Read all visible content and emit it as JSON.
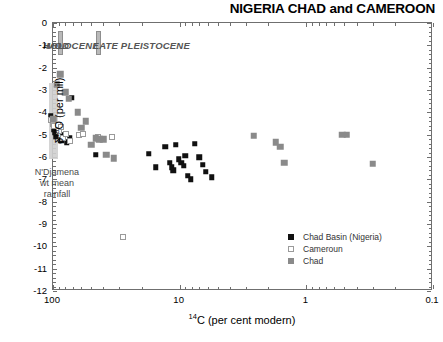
{
  "title": "NIGERIA CHAD and CAMEROON",
  "axes": {
    "y_title_html": "δ<sup>18</sup>O (per mil)",
    "y_title_plain": "δ18O (per mil)",
    "x_title_plain": "14C (per cent modern)",
    "y_ticks": [
      "0",
      "-1",
      "-2",
      "-3",
      "-4",
      "-5",
      "-6",
      "-7",
      "-8",
      "-9",
      "-10",
      "-11",
      "-12"
    ],
    "x_ticks": [
      "100",
      "10",
      "1",
      "0.1"
    ]
  },
  "eras": [
    {
      "label": "MOD",
      "x": 0.22
    },
    {
      "label": "HOLOCENE",
      "x": 0.7
    },
    {
      "label": "LATE PLEISTOCENE",
      "x": 2.15
    }
  ],
  "annotation": {
    "line1": "N'Djamena",
    "line2": "wt mean",
    "line3": "rainfall"
  },
  "legend": {
    "items": [
      {
        "label": "Chad Basin (Nigeria)",
        "key": "nigeria",
        "color": "#111111"
      },
      {
        "label": "Cameroun",
        "key": "cameroun",
        "color": "#ffffff"
      },
      {
        "label": "Chad",
        "key": "chad",
        "color": "#8a8a8a"
      }
    ]
  },
  "colors": {
    "nigeria": "#111111",
    "cameroun": "#ffffff",
    "cameroun_edge": "#9a9a9a",
    "chad": "#8a8a8a",
    "axis": "#6f6f6f",
    "band": "#cfcfcf",
    "era_text": "#555555"
  },
  "chart_data": {
    "type": "scatter",
    "title": "NIGERIA CHAD and CAMEROON",
    "xlabel": "14C (per cent modern)",
    "ylabel": "d18O (per mil)",
    "xscale": "log",
    "x_reversed": true,
    "xlim": [
      100,
      0.1
    ],
    "ylim": [
      -12,
      0
    ],
    "x_ticks": [
      100,
      10,
      1,
      0.1
    ],
    "y_ticks": [
      0,
      -1,
      -2,
      -3,
      -4,
      -5,
      -6,
      -7,
      -8,
      -9,
      -10,
      -11,
      -12
    ],
    "grid": false,
    "legend_position": "bottom-right",
    "annotations": [
      {
        "text": "MOD",
        "x": 92,
        "y": -1.0,
        "style": "bold-italic-gray"
      },
      {
        "text": "HOLOCENE",
        "x": 72,
        "y": -1.0,
        "style": "bold-italic-gray"
      },
      {
        "text": "LATE PLEISTOCENE",
        "x": 20,
        "y": -1.0,
        "style": "bold-italic-gray"
      },
      {
        "text": "N'Djamena wt mean rainfall",
        "x": 93,
        "y": -6.6,
        "style": "gray"
      }
    ],
    "bands": [
      {
        "type": "vband",
        "label": "N'Djamena wt mean rainfall",
        "x_center": 100,
        "y_range": [
          -6.1,
          -2.7
        ],
        "color": "#cfcfcf"
      },
      {
        "type": "vline-marker",
        "label": "MOD/HOLOCENE divider",
        "x": 88,
        "y_range": [
          -1.45,
          -0.35
        ],
        "color": "#b9b9b9"
      },
      {
        "type": "vline-marker",
        "label": "HOLOCENE/LATE PLEISTOCENE divider",
        "x": 44,
        "y_range": [
          -1.45,
          -0.35
        ],
        "color": "#b9b9b9"
      }
    ],
    "series": [
      {
        "name": "Chad Basin (Nigeria)",
        "marker": "filled-square",
        "color": "#111111",
        "points": [
          {
            "x": 104,
            "y": -4.15
          },
          {
            "x": 99,
            "y": -4.75
          },
          {
            "x": 97,
            "y": -4.9
          },
          {
            "x": 95,
            "y": -5.1
          },
          {
            "x": 86,
            "y": -5.25
          },
          {
            "x": 84,
            "y": -5.0
          },
          {
            "x": 78,
            "y": -5.35
          },
          {
            "x": 74,
            "y": -5.15
          },
          {
            "x": 71,
            "y": -3.35
          },
          {
            "x": 46,
            "y": -5.9
          },
          {
            "x": 17.5,
            "y": -5.85
          },
          {
            "x": 15.5,
            "y": -6.45
          },
          {
            "x": 13.0,
            "y": -5.55
          },
          {
            "x": 12.0,
            "y": -6.25
          },
          {
            "x": 11.6,
            "y": -6.45
          },
          {
            "x": 11.2,
            "y": -6.6
          },
          {
            "x": 10.7,
            "y": -5.45
          },
          {
            "x": 10.2,
            "y": -6.1
          },
          {
            "x": 9.7,
            "y": -6.25
          },
          {
            "x": 9.3,
            "y": -6.4
          },
          {
            "x": 9.0,
            "y": -5.95
          },
          {
            "x": 8.6,
            "y": -6.85
          },
          {
            "x": 8.2,
            "y": -7.0
          },
          {
            "x": 7.6,
            "y": -5.4
          },
          {
            "x": 7.0,
            "y": -6.0
          },
          {
            "x": 6.6,
            "y": -6.35
          },
          {
            "x": 6.2,
            "y": -6.65
          },
          {
            "x": 5.6,
            "y": -6.9
          }
        ]
      },
      {
        "name": "Cameroun",
        "marker": "open-square",
        "color": "#ffffff",
        "points": [
          {
            "x": 103,
            "y": -4.35
          },
          {
            "x": 100,
            "y": -4.5
          },
          {
            "x": 98,
            "y": -4.6
          },
          {
            "x": 92,
            "y": -4.55
          },
          {
            "x": 90,
            "y": -4.85
          },
          {
            "x": 86,
            "y": -4.65
          },
          {
            "x": 83,
            "y": -5.15
          },
          {
            "x": 79,
            "y": -4.95
          },
          {
            "x": 73,
            "y": -5.3
          },
          {
            "x": 62,
            "y": -5.0
          },
          {
            "x": 58,
            "y": -4.95
          },
          {
            "x": 44,
            "y": -5.1
          },
          {
            "x": 34,
            "y": -5.1
          },
          {
            "x": 28,
            "y": -9.6
          }
        ]
      },
      {
        "name": "Chad",
        "marker": "gray-square",
        "color": "#8a8a8a",
        "points": [
          {
            "x": 93,
            "y": -2.75
          },
          {
            "x": 88,
            "y": -2.3
          },
          {
            "x": 80,
            "y": -3.1
          },
          {
            "x": 75,
            "y": -3.4
          },
          {
            "x": 64,
            "y": -4.0
          },
          {
            "x": 60,
            "y": -4.7
          },
          {
            "x": 55,
            "y": -4.4
          },
          {
            "x": 50,
            "y": -5.45
          },
          {
            "x": 46,
            "y": -5.15
          },
          {
            "x": 43,
            "y": -5.2
          },
          {
            "x": 40,
            "y": -5.2
          },
          {
            "x": 38,
            "y": -5.9
          },
          {
            "x": 33,
            "y": -6.05
          },
          {
            "x": 100,
            "y": -4.3
          },
          {
            "x": 2.6,
            "y": -5.05
          },
          {
            "x": 1.75,
            "y": -5.35
          },
          {
            "x": 1.6,
            "y": -5.55
          },
          {
            "x": 1.5,
            "y": -6.25
          },
          {
            "x": 0.52,
            "y": -5.0
          },
          {
            "x": 0.48,
            "y": -5.0
          },
          {
            "x": 0.3,
            "y": -6.3
          }
        ]
      }
    ]
  }
}
